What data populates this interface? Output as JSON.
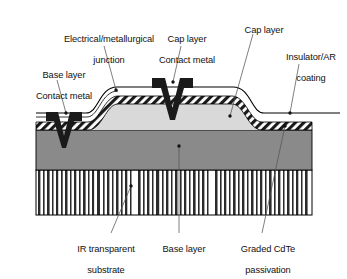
{
  "figure": {
    "background_color": "#ffffff"
  },
  "colors": {
    "cap_layer_fill": "#d9d9d9",
    "base_layer_fill": "#8a8a8a",
    "contact_metal_fill": "#1a1a1a",
    "substrate_stripe": "#2b2b2b",
    "substrate_background": "#ffffff",
    "insulator_hatch": "#1a1a1a",
    "outline": "#000000",
    "leader_line": "#555555",
    "text": "#111111"
  },
  "labels": {
    "electrical_junction": {
      "line1": "Electrical/metallurgical",
      "line2": "junction"
    },
    "base_layer_contact_metal": {
      "line1": "Base layer",
      "line2": "Contact metal"
    },
    "cap_layer_contact_metal": {
      "line1": "Cap layer",
      "line2": "Contact metal"
    },
    "cap_layer": {
      "line1": "Cap layer"
    },
    "insulator_ar_coating": {
      "line1": "Insulator/AR",
      "line2": "coating"
    },
    "ir_transparent_substrate": {
      "line1": "IR transparent",
      "line2": "substrate"
    },
    "base_layer": {
      "line1": "Base layer"
    },
    "graded_cdte_passivation": {
      "line1": "Graded CdTe",
      "line2": "passivation"
    }
  },
  "layers": [
    {
      "name": "substrate",
      "description": "IR transparent substrate with vertical stripe fill",
      "top": 170,
      "bottom": 215
    },
    {
      "name": "base-layer",
      "description": "Base layer, medium gray fill",
      "top": 130,
      "bottom": 170
    },
    {
      "name": "cap-layer",
      "description": "Cap layer mesa, light gray fill",
      "top": 92,
      "bottom": 130
    },
    {
      "name": "passivation",
      "description": "Graded CdTe passivation / insulator AR coating, diagonal hatch band"
    }
  ],
  "contacts": [
    {
      "name": "base-layer-contact",
      "shape": "V",
      "position": "left",
      "penetrates_to": "base-layer"
    },
    {
      "name": "cap-layer-contact",
      "shape": "V",
      "position": "center",
      "penetrates_to": "cap-layer"
    }
  ]
}
